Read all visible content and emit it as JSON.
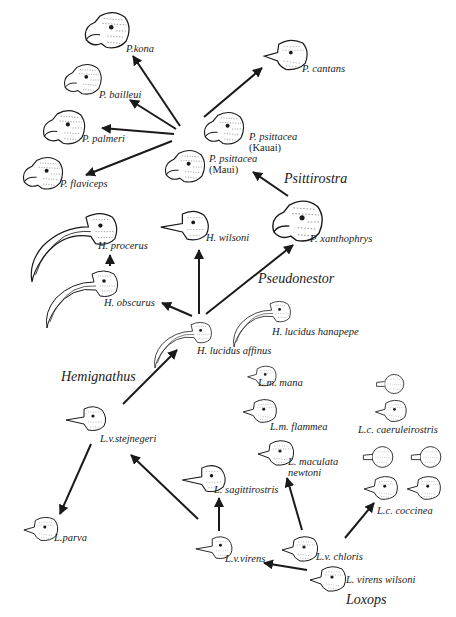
{
  "diagram": {
    "type": "phylogenetic-radiation"
  },
  "genus_labels": {
    "psittirostra": "Psittirostra",
    "pseudonestor": "Pseudonestor",
    "hemignathus": "Hemignathus",
    "loxops": "Loxops"
  },
  "species": {
    "p_kona": "P.kona",
    "p_bailleui": "P. bailleui",
    "p_palmeri": "P. palmeri",
    "p_flaviceps": "P. flaviceps",
    "p_cantans": "P. cantans",
    "p_psittacea_kauai": "P. psittacea",
    "p_psittacea_kauai_loc": "(Kauai)",
    "p_psittacea_maui": "P. psittacea",
    "p_psittacea_maui_loc": "(Maui)",
    "p_xanthophrys": "P. xanthophrys",
    "h_procerus": "H. procerus",
    "h_wilsoni": "H. wilsoni",
    "h_obscurus": "H. obscurus",
    "h_lucidus_affinus": "H. lucidus affinus",
    "h_lucidus_hanapepe": "H. lucidus hanapepe",
    "l_m_mana": "L.m. mana",
    "l_m_flammea": "L.m. flammea",
    "l_maculata_newtoni_1": "L. maculata",
    "l_maculata_newtoni_2": "newtoni",
    "l_c_caeruleirostris": "L.c. caeruleirostris",
    "l_v_stejnegeri": "L.v.stejnegeri",
    "l_sagittirostris": "L. sagittirostris",
    "l_parva": "L.parva",
    "l_c_coccinea": "L.c. coccinea",
    "l_v_virens": "L.v.virens",
    "l_v_chloris": "L.v. chloris",
    "l_virens_wilsoni": "L. virens wilsoni"
  },
  "edges": [
    {
      "from": "L. virens wilsoni",
      "to": "L.v.virens"
    },
    {
      "from": "L. virens wilsoni",
      "to": "L.v. chloris"
    },
    {
      "from": "L.v.virens",
      "to": "L. sagittirostris"
    },
    {
      "from": "L.v.virens",
      "to": "L.v.stejnegeri"
    },
    {
      "from": "L.v. chloris",
      "to": "L. maculata newtoni"
    },
    {
      "from": "L.v. chloris",
      "to": "L.c. coccinea"
    },
    {
      "from": "L.v.stejnegeri",
      "to": "L.parva"
    },
    {
      "from": "L.v.stejnegeri",
      "to": "H. lucidus affinus"
    },
    {
      "from": "H. lucidus affinus",
      "to": "H. obscurus"
    },
    {
      "from": "H. lucidus affinus",
      "to": "H. wilsoni"
    },
    {
      "from": "H. lucidus affinus",
      "to": "P. xanthophrys"
    },
    {
      "from": "H. obscurus",
      "to": "H. procerus"
    },
    {
      "from": "P. xanthophrys",
      "to": "P. psittacea (Maui)"
    },
    {
      "from": "Psittirostra hub",
      "to": "P.kona"
    },
    {
      "from": "Psittirostra hub",
      "to": "P. bailleui"
    },
    {
      "from": "Psittirostra hub",
      "to": "P. palmeri"
    },
    {
      "from": "Psittirostra hub",
      "to": "P. flaviceps"
    },
    {
      "from": "Psittirostra hub",
      "to": "P. cantans"
    }
  ],
  "colors": {
    "ink": "#1a1a1a",
    "background": "#ffffff"
  }
}
